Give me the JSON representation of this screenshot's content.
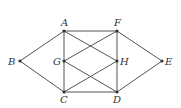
{
  "diagram": {
    "type": "graph",
    "nodes": [
      {
        "id": "A",
        "label": "A",
        "x": 64,
        "y": 31,
        "lx": 61,
        "ly": 26
      },
      {
        "id": "B",
        "label": "B",
        "x": 20,
        "y": 61,
        "lx": 8,
        "ly": 65
      },
      {
        "id": "C",
        "label": "C",
        "x": 64,
        "y": 92,
        "lx": 60,
        "ly": 103
      },
      {
        "id": "D",
        "label": "D",
        "x": 117,
        "y": 92,
        "lx": 113,
        "ly": 103
      },
      {
        "id": "E",
        "label": "E",
        "x": 162,
        "y": 61,
        "lx": 165,
        "ly": 65
      },
      {
        "id": "F",
        "label": "F",
        "x": 117,
        "y": 31,
        "lx": 114,
        "ly": 26
      },
      {
        "id": "G",
        "label": "G",
        "x": 64,
        "y": 61,
        "lx": 53,
        "ly": 65
      },
      {
        "id": "H",
        "label": "H",
        "x": 117,
        "y": 61,
        "lx": 120,
        "ly": 65
      }
    ],
    "edges": [
      [
        "B",
        "A"
      ],
      [
        "B",
        "C"
      ],
      [
        "A",
        "F"
      ],
      [
        "A",
        "G"
      ],
      [
        "G",
        "C"
      ],
      [
        "A",
        "H"
      ],
      [
        "F",
        "G"
      ],
      [
        "F",
        "H"
      ],
      [
        "H",
        "D"
      ],
      [
        "F",
        "E"
      ],
      [
        "E",
        "D"
      ],
      [
        "C",
        "D"
      ],
      [
        "G",
        "D"
      ],
      [
        "C",
        "H"
      ]
    ],
    "colors": {
      "edge": "#555555",
      "node": "#333333"
    }
  }
}
